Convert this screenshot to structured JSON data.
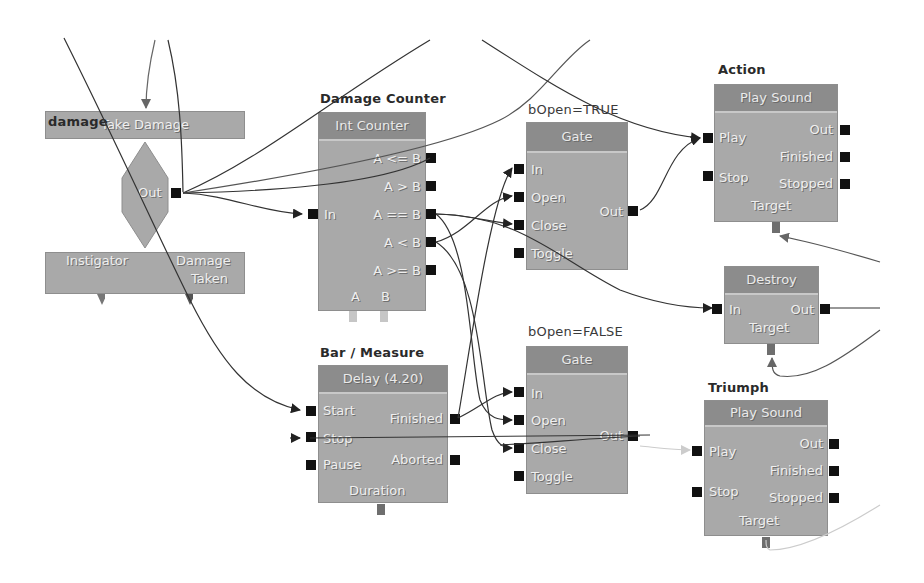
{
  "canvas": {
    "background": "#ffffff",
    "node_fill": "#a9a9a9",
    "header_fill": "#8c8c8c",
    "pin_color": "#111111",
    "var_pin_color": "#6e6e6e",
    "wire_color": "#333333"
  },
  "nodes": {
    "damage_event": {
      "comment": "damage",
      "title": "Take Damage",
      "out_label": "Out",
      "vars": [
        "Instigator",
        "Damage Taken"
      ],
      "var_line1": "Instigator",
      "var_line2a": "Damage",
      "var_line2b": "Taken"
    },
    "damage_counter": {
      "comment": "Damage Counter",
      "title": "Int Counter",
      "in_label": "In",
      "outputs": [
        "A <= B",
        "A > B",
        "A == B",
        "A < B",
        "A >= B"
      ],
      "vars": [
        "A",
        "B"
      ]
    },
    "gate_true": {
      "comment": "bOpen=TRUE",
      "title": "Gate",
      "inputs": [
        "In",
        "Open",
        "Close",
        "Toggle"
      ],
      "outputs": [
        "Out"
      ]
    },
    "gate_false": {
      "comment": "bOpen=FALSE",
      "title": "Gate",
      "inputs": [
        "In",
        "Open",
        "Close",
        "Toggle"
      ],
      "outputs": [
        "Out"
      ]
    },
    "action_sound": {
      "comment": "Action",
      "title": "Play Sound",
      "inputs": [
        "Play",
        "Stop"
      ],
      "outputs": [
        "Out",
        "Finished",
        "Stopped"
      ],
      "var": "Target"
    },
    "destroy": {
      "title": "Destroy",
      "inputs": [
        "In"
      ],
      "outputs": [
        "Out"
      ],
      "var": "Target"
    },
    "delay": {
      "comment": "Bar / Measure",
      "title": "Delay (4.20)",
      "inputs": [
        "Start",
        "Stop",
        "Pause"
      ],
      "outputs": [
        "Finished",
        "Aborted"
      ],
      "var": "Duration"
    },
    "triumph_sound": {
      "comment": "Triumph",
      "title": "Play Sound",
      "inputs": [
        "Play",
        "Stop"
      ],
      "outputs": [
        "Out",
        "Finished",
        "Stopped"
      ],
      "var": "Target"
    }
  }
}
